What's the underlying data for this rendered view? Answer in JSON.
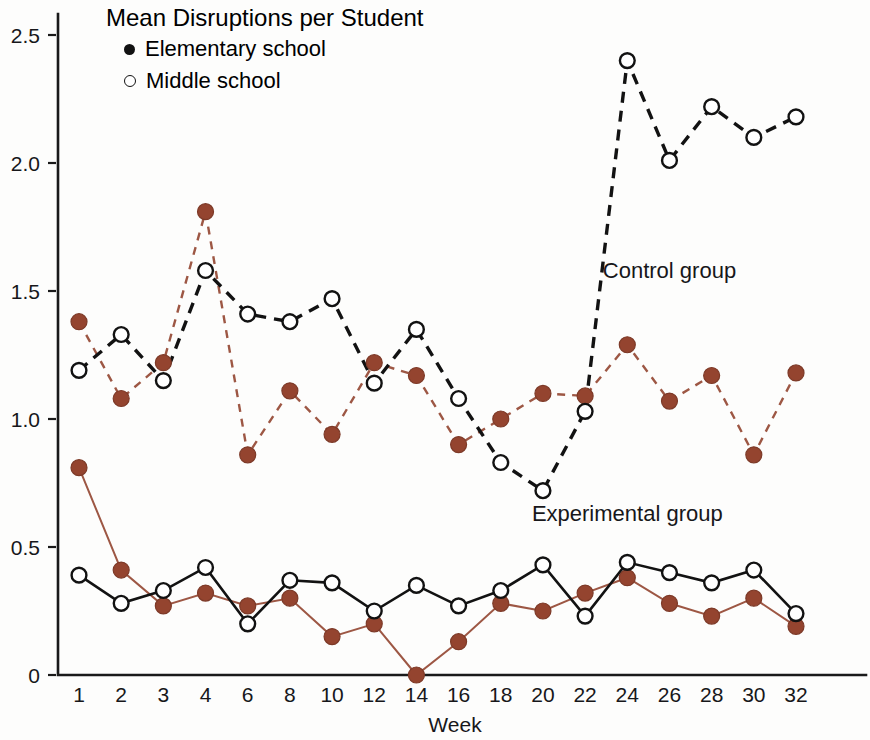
{
  "chart_data": {
    "type": "line",
    "title": "Mean Disruptions per Student",
    "xlabel": "Week",
    "ylabel": "",
    "categories": [
      "1",
      "2",
      "3",
      "4",
      "6",
      "8",
      "10",
      "12",
      "14",
      "16",
      "18",
      "20",
      "22",
      "24",
      "26",
      "28",
      "30",
      "32"
    ],
    "x_tick_labels": [
      "1",
      "2",
      "3",
      "4",
      "6",
      "8",
      "10",
      "12",
      "14",
      "16",
      "18",
      "20",
      "22",
      "24",
      "26",
      "28",
      "30",
      "32"
    ],
    "y_tick_labels": [
      "0",
      "0.5",
      "1.0",
      "1.5",
      "2.0",
      "2.5"
    ],
    "y_tick_values": [
      0,
      0.5,
      1.0,
      1.5,
      2.0,
      2.5
    ],
    "ylim": [
      0,
      2.55
    ],
    "grid": false,
    "legend_position": "top-left",
    "legend": [
      {
        "label": "Elementary school",
        "marker": "filled-circle",
        "color": "#94442f"
      },
      {
        "label": "Middle school",
        "marker": "open-circle",
        "color": "#121212"
      }
    ],
    "annotations": [
      {
        "text": "Control group",
        "x_week": "26",
        "y_value": 1.55
      },
      {
        "text": "Experimental group",
        "x_week": "24",
        "y_value": 0.6
      }
    ],
    "series": [
      {
        "name": "Control group - Elementary school",
        "group": "Control group",
        "school": "Elementary school",
        "marker": "filled-circle",
        "color": "#94442f",
        "line_style": "dashed",
        "values": [
          1.38,
          1.08,
          1.22,
          1.81,
          0.86,
          1.11,
          0.94,
          1.22,
          1.17,
          0.9,
          1.0,
          1.1,
          1.09,
          1.29,
          1.07,
          1.17,
          0.86,
          1.18
        ]
      },
      {
        "name": "Control group - Middle school",
        "group": "Control group",
        "school": "Middle school",
        "marker": "open-circle",
        "color": "#121212",
        "line_style": "dashed",
        "values": [
          1.19,
          1.33,
          1.15,
          1.58,
          1.41,
          1.38,
          1.47,
          1.14,
          1.35,
          1.08,
          0.83,
          0.72,
          1.03,
          2.4,
          2.01,
          2.22,
          2.1,
          2.18
        ]
      },
      {
        "name": "Experimental group - Elementary school",
        "group": "Experimental group",
        "school": "Elementary school",
        "marker": "filled-circle",
        "color": "#94442f",
        "line_style": "solid",
        "values": [
          0.81,
          0.41,
          0.27,
          0.32,
          0.27,
          0.3,
          0.15,
          0.2,
          0.0,
          0.13,
          0.28,
          0.25,
          0.32,
          0.38,
          0.28,
          0.23,
          0.3,
          0.19
        ]
      },
      {
        "name": "Experimental group - Middle school",
        "group": "Experimental group",
        "school": "Middle school",
        "marker": "open-circle",
        "color": "#121212",
        "line_style": "solid",
        "values": [
          0.39,
          0.28,
          0.33,
          0.42,
          0.2,
          0.37,
          0.36,
          0.25,
          0.35,
          0.27,
          0.33,
          0.43,
          0.23,
          0.44,
          0.4,
          0.36,
          0.41,
          0.24
        ]
      }
    ]
  }
}
